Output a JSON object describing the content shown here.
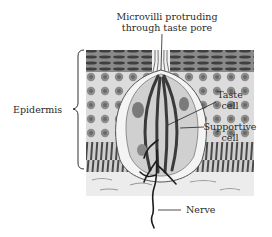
{
  "diagram": {
    "labels": {
      "microvilli_line1": "Microvilli protruding",
      "microvilli_line2": "through taste pore",
      "epidermis": "Epidermis",
      "taste_cell_line1": "Taste",
      "taste_cell_line2": "cell",
      "supportive_cell_line1": "Supportive",
      "supportive_cell_line2": "cell",
      "nerve": "Nerve"
    },
    "colors": {
      "background": "#ffffff",
      "ink": "#222222",
      "top_layer": "#5a5a5a",
      "cell_layer": "#bdbdbd",
      "basal_layer": "#6e6e6e",
      "dermis": "#eeeeee"
    }
  }
}
